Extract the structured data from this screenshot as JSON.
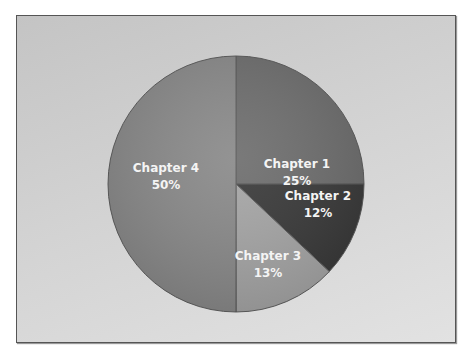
{
  "chart_data": {
    "type": "pie",
    "title": "",
    "categories": [
      "Chapter 1",
      "Chapter 2",
      "Chapter 3",
      "Chapter 4"
    ],
    "values": [
      25,
      12,
      13,
      50
    ],
    "labels": [
      "25%",
      "12%",
      "13%",
      "50%"
    ],
    "start_angle": "12 o'clock",
    "direction": "clockwise",
    "legend": "none",
    "data_labels": "inside, category name + percentage",
    "colors": [
      "#6e6e6e",
      "#3a3a3a",
      "#a6a6a6",
      "#8a8a8a"
    ]
  },
  "slices": [
    {
      "name": "Chapter 1",
      "pct": "25%"
    },
    {
      "name": "Chapter 2",
      "pct": "12%"
    },
    {
      "name": "Chapter 3",
      "pct": "13%"
    },
    {
      "name": "Chapter 4",
      "pct": "50%"
    }
  ]
}
